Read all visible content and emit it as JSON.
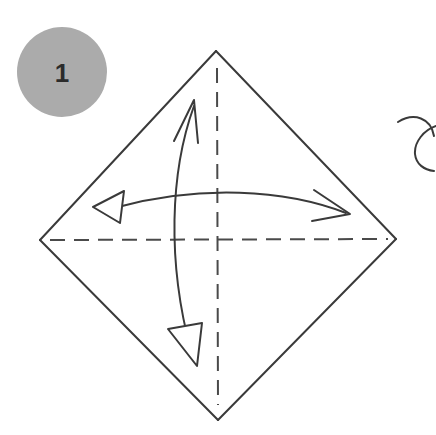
{
  "diagram": {
    "background_color": "#ffffff",
    "line_color": "#3a3a3a",
    "line_width": 2,
    "canvas": {
      "width": 436,
      "height": 435
    }
  },
  "step_badge": {
    "name": "step-number-badge",
    "label": "1",
    "fill_color": "#ababab",
    "text_color": "#2b2b2b",
    "center_x": 62,
    "center_y": 72,
    "radius": 45
  },
  "shape": {
    "name": "square-rotated-diamond",
    "description": "Square paper rotated 45 degrees (diamond orientation)",
    "stroke_color": "#3a3a3a",
    "vertices": {
      "top": {
        "x": 216,
        "y": 51
      },
      "right": {
        "x": 396,
        "y": 239
      },
      "bottom": {
        "x": 218,
        "y": 420
      },
      "left": {
        "x": 40,
        "y": 240
      }
    }
  },
  "crease_lines": [
    {
      "name": "vertical-crease-line",
      "style": "dashed",
      "label": "valley crease (vertical)",
      "x1": 217,
      "y1": 68,
      "x2": 218,
      "y2": 405,
      "dash": "15 9"
    },
    {
      "name": "horizontal-crease-line",
      "style": "dashed",
      "label": "valley crease (horizontal)",
      "x1": 50,
      "y1": 240,
      "x2": 388,
      "y2": 239,
      "dash": "15 9"
    }
  ],
  "arrows": [
    {
      "name": "vertical-fold-arrow",
      "label": "fold top corner down to bottom corner",
      "type": "double-headed-curve",
      "head_top": {
        "style": "open-barb",
        "tip_x": 194,
        "tip_y": 101
      },
      "head_bottom": {
        "style": "closed-triangle",
        "tip_x": 197,
        "tip_y": 366
      },
      "path": "M 194 106 C 171 170 168 260 191 350"
    },
    {
      "name": "horizontal-fold-arrow",
      "label": "fold left corner over to right corner",
      "type": "double-headed-curve",
      "head_left": {
        "style": "closed-triangle",
        "tip_x": 93,
        "tip_y": 207
      },
      "head_right": {
        "style": "open-barb",
        "tip_x": 350,
        "tip_y": 214
      },
      "path": "M 120 207 C 200 186 285 190 345 212"
    },
    {
      "name": "turn-over-arrow-partial",
      "label": "turn over / rotate arrow (cropped at right edge)",
      "type": "hook-curve-cropped",
      "path": "M 398 120 C 416 113 432 121 434 139 C 435 155 425 165 414 166"
    }
  ]
}
